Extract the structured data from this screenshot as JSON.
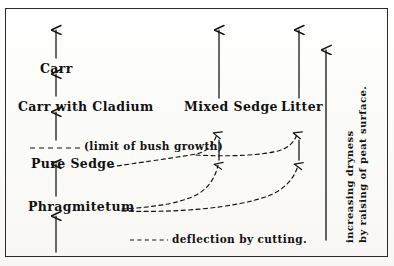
{
  "diagram": {
    "title_text_present": false,
    "frame": {
      "stroke": "#2b2b2b"
    },
    "ink_color": "#111111",
    "succession_columns": [
      {
        "id": "left-column",
        "stages": [
          {
            "key": "carr",
            "label": "Carr"
          },
          {
            "key": "carr_with_cladium",
            "label": "Carr with Cladium"
          },
          {
            "key": "pure_sedge",
            "label": "Pure Sedge"
          },
          {
            "key": "phragmitetum",
            "label": "Phragmitetum"
          }
        ]
      },
      {
        "id": "middle-column",
        "stages": [
          {
            "key": "mixed_sedge",
            "label": "Mixed Sedge"
          }
        ]
      },
      {
        "id": "right-column",
        "stages": [
          {
            "key": "litter",
            "label": "Litter"
          }
        ]
      }
    ],
    "annotations": {
      "limit_of_bush_growth": "(limit of bush growth)",
      "legend_deflection": "deflection by cutting.",
      "axis_line_1": "increasing dryness",
      "axis_line_2": "by raising of peat surface."
    }
  }
}
